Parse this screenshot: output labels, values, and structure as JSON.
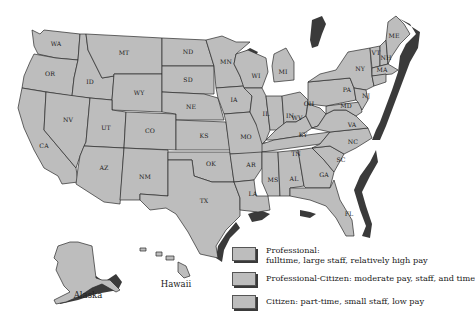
{
  "map": {
    "fill_color": "#bdbdbd",
    "shadow_color": "#3a3a3a",
    "states": {
      "WA": "WA",
      "OR": "OR",
      "CA": "CA",
      "ID": "ID",
      "NV": "NV",
      "MT": "MT",
      "WY": "WY",
      "UT": "UT",
      "AZ": "AZ",
      "CO": "CO",
      "NM": "NM",
      "ND": "ND",
      "SD": "SD",
      "NE": "NE",
      "KS": "KS",
      "OK": "OK",
      "TX": "TX",
      "MN": "MN",
      "IA": "IA",
      "MO": "MO",
      "AR": "AR",
      "LA": "LA",
      "WI": "WI",
      "IL": "IL",
      "MI": "MI",
      "IN": "IN",
      "OH": "OH",
      "KY": "KY",
      "TN": "TN",
      "MS": "MS",
      "AL": "AL",
      "GA": "GA",
      "FL": "FL",
      "SC": "SC",
      "NC": "NC",
      "VA": "VA",
      "WV": "WV",
      "PA": "PA",
      "NY": "NY",
      "VT": "VT",
      "NH": "NH",
      "ME": "ME",
      "MA": "MA",
      "NJ": "NJ",
      "MD": "MD"
    },
    "insets": {
      "alaska": "Alaska",
      "hawaii": "Hawaii"
    }
  },
  "legend": {
    "items": [
      {
        "line1": "Professional:",
        "line2": "fulltime, large staff, relatively high pay"
      },
      {
        "line1": "Professional-Citizen: moderate pay, staff, and time"
      },
      {
        "line1": "Citizen: part-time, small staff, low pay"
      }
    ]
  }
}
